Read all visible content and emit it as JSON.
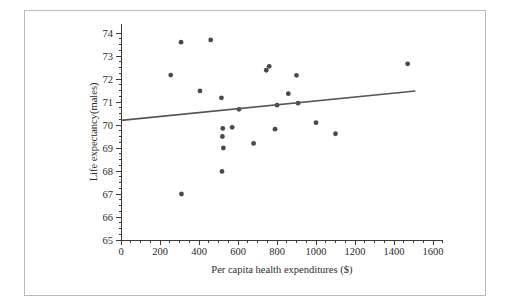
{
  "chart_data": {
    "type": "scatter",
    "title": "",
    "xlabel": "Per capita health expenditures ($)",
    "ylabel": "Life expectancy(males)",
    "xlim": [
      0,
      1650
    ],
    "ylim": [
      65,
      74.4
    ],
    "grid": false,
    "legend": null,
    "x_ticks": [
      0,
      200,
      400,
      600,
      800,
      1000,
      1200,
      1400,
      1600
    ],
    "x_tick_labels": [
      "0",
      "200",
      "400",
      "600",
      "800",
      "1000",
      "1200",
      "1400",
      "1600"
    ],
    "x_minor_tick_step": 50,
    "y_ticks": [
      65,
      66,
      67,
      68,
      69,
      70,
      71,
      72,
      73,
      74
    ],
    "y_tick_labels": [
      "65",
      "66",
      "67",
      "68",
      "69",
      "70",
      "71",
      "72",
      "73",
      "74"
    ],
    "y_minor_tick_step": 0.25,
    "point_color": "#4a4a4a",
    "point_size": 2.4,
    "points": [
      {
        "x": 255,
        "y": 72.17
      },
      {
        "x": 308,
        "y": 73.6
      },
      {
        "x": 310,
        "y": 67.0
      },
      {
        "x": 405,
        "y": 71.48
      },
      {
        "x": 460,
        "y": 73.7
      },
      {
        "x": 515,
        "y": 71.18
      },
      {
        "x": 518,
        "y": 67.98
      },
      {
        "x": 520,
        "y": 69.5
      },
      {
        "x": 522,
        "y": 69.85
      },
      {
        "x": 525,
        "y": 69.0
      },
      {
        "x": 570,
        "y": 69.9
      },
      {
        "x": 605,
        "y": 70.68
      },
      {
        "x": 680,
        "y": 69.2
      },
      {
        "x": 745,
        "y": 72.38
      },
      {
        "x": 760,
        "y": 72.55
      },
      {
        "x": 790,
        "y": 69.82
      },
      {
        "x": 800,
        "y": 70.86
      },
      {
        "x": 858,
        "y": 71.36
      },
      {
        "x": 900,
        "y": 72.16
      },
      {
        "x": 908,
        "y": 70.95
      },
      {
        "x": 1000,
        "y": 70.1
      },
      {
        "x": 1100,
        "y": 69.62
      },
      {
        "x": 1470,
        "y": 72.66
      }
    ],
    "trend_line": {
      "label": "regression line",
      "color": "#555555",
      "x_start": 0,
      "y_start": 70.2,
      "x_end": 1510,
      "y_end": 71.48
    }
  },
  "frame": {
    "border_color": "#b9b9b9",
    "background": "#ffffff"
  }
}
